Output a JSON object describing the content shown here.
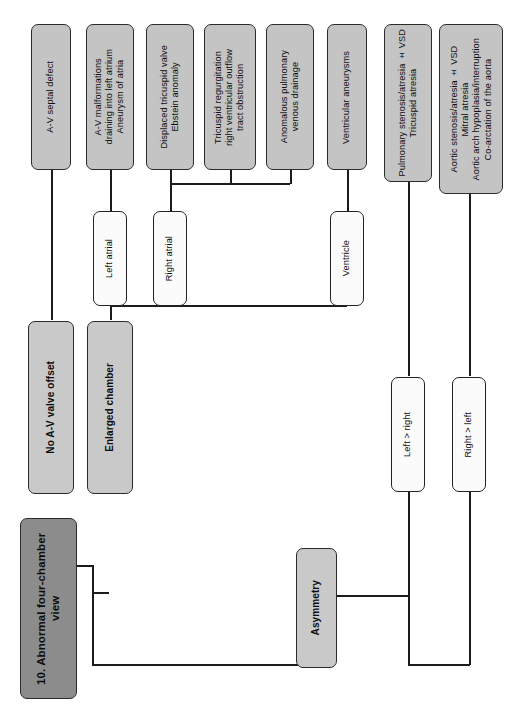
{
  "diagram": {
    "title": "10. Abnormal four-chamber view",
    "orientation": "rotated-90-vertical-text",
    "colors": {
      "root_fill": "#8c8c8c",
      "branch_fill": "#c9c9c9",
      "leaf_fill": "#c4c4c4",
      "decision_fill": "#fbfbfb",
      "line": "#1c1c1c"
    }
  },
  "nodes": {
    "root": "10. Abnormal four-chamber view",
    "no_av_valve_offset": "No A-V valve offset",
    "enlarged_chamber": "Enlarged chamber",
    "asymmetry": "Asymmetry",
    "left_atrial": "Left atrial",
    "right_atrial": "Right atrial",
    "ventricle": "Ventricle",
    "left_greater_right": "Left > right",
    "right_greater_left": "Right > left",
    "av_septal_defect": "A-V septal defect",
    "av_malformations": "A-V malformations\ndraining into left atrium\nAneurysm of atria",
    "displaced_tricuspid_valve": "Displaced tricuspid valve\nEbstein anomaly",
    "tricuspid_regurgitation": "Tricuspid regurgitation\nright ventricular outflow\ntract obstruction",
    "anomalous_pulmonary_venous_drainage": "Anomalous pulmonary\nvenous drainage",
    "ventricular_aneurysms": "Ventricular aneurysms",
    "pulmonary_stenosis": "Pulmonary stenosis/atresia ± VSD\nTricuspid atresia",
    "aortic_stenosis": "Aortic stenosis/atresia ± VSD\nMitral atresia\nAortic arch hypoplasia/interruption\nCo-arctation of the aorta"
  }
}
